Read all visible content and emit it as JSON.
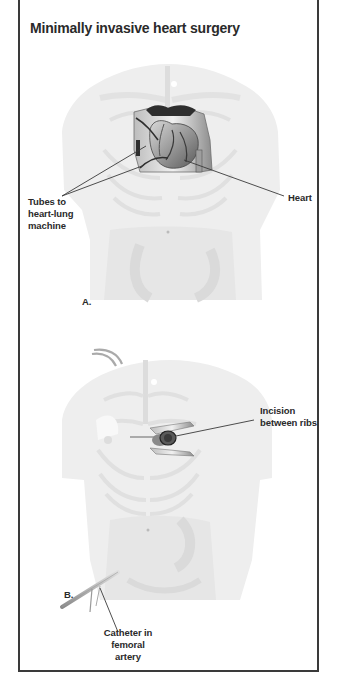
{
  "figure": {
    "title": "Minimally invasive heart surgery",
    "panels": [
      {
        "id": "A",
        "marker": "A.",
        "callouts": [
          {
            "text": "Tubes to\nheart-lung\nmachine"
          },
          {
            "text": "Heart"
          }
        ]
      },
      {
        "id": "B",
        "marker": "B.",
        "callouts": [
          {
            "text": "Incision\nbetween ribs"
          },
          {
            "text": "Catheter in\nfemoral artery"
          }
        ]
      }
    ]
  },
  "colors": {
    "frame": "#3a3a3a",
    "text": "#2a2a2a",
    "body_fill": "#ececec",
    "rib": "#dcdcdc",
    "organ_dark": "#2e2e2e",
    "organ_mid": "#8a8a8a"
  }
}
